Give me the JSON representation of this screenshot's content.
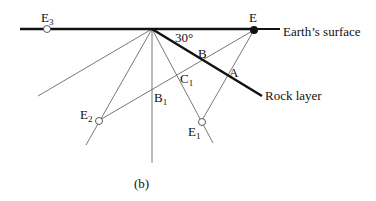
{
  "figure": {
    "caption": "(b)",
    "angle_label": "30°",
    "surface_label": "Earth’s surface",
    "rock_label": "Rock layer",
    "points": {
      "E": {
        "main": "E",
        "sub": ""
      },
      "E1": {
        "main": "E",
        "sub": "1"
      },
      "E2": {
        "main": "E",
        "sub": "2"
      },
      "E3": {
        "main": "E",
        "sub": "3"
      },
      "A": {
        "main": "A",
        "sub": ""
      },
      "B": {
        "main": "B",
        "sub": ""
      },
      "B1": {
        "main": "B",
        "sub": "1"
      },
      "C1": {
        "main": "C",
        "sub": "1"
      }
    },
    "colors": {
      "line": "#111111",
      "thin": "#555555",
      "background": "#ffffff"
    }
  }
}
